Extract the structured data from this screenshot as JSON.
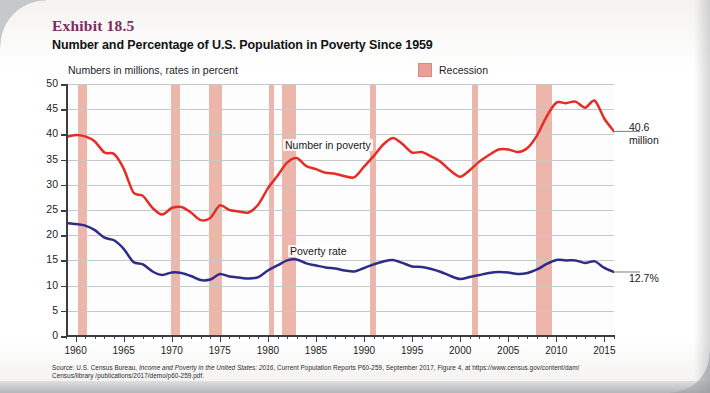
{
  "exhibit": {
    "label": "Exhibit 18.5",
    "title": "Number and Percentage of U.S. Population in Poverty Since 1959",
    "subtitle": "Numbers in millions, rates in percent"
  },
  "legend": {
    "recession_label": "Recession",
    "recession_color": "#e8a194"
  },
  "callouts": {
    "number_value": "40.6",
    "number_unit": "million",
    "rate_value": "12.7%"
  },
  "source": {
    "line1_a": "Source: U.S. Census Bureau, ",
    "line1_b": "Income and Poverty in the United States: 2016",
    "line1_c": ", Current Population Reports P60-259, September 2017, Figure 4, at https://www.census.gov/content/dam/",
    "line2": "Census/library /publications/2017/demo/p60-259.pdf."
  },
  "chart_data": {
    "type": "line",
    "title": "Number and Percentage of U.S. Population in Poverty Since 1959",
    "subtitle": "Numbers in millions, rates in percent",
    "xlabel": "",
    "ylabel": "",
    "xlim": [
      1959,
      2016
    ],
    "ylim": [
      0,
      50
    ],
    "ytick_labels": [
      "0",
      "5",
      "10",
      "15",
      "20",
      "25",
      "30",
      "35",
      "40",
      "45",
      "50"
    ],
    "ytick_values": [
      0,
      5,
      10,
      15,
      20,
      25,
      30,
      35,
      40,
      45,
      50
    ],
    "xtick_labels": [
      "1960",
      "1965",
      "1970",
      "1975",
      "1980",
      "1985",
      "1990",
      "1995",
      "2000",
      "2005",
      "2010",
      "2015"
    ],
    "xtick_values": [
      1960,
      1965,
      1970,
      1975,
      1980,
      1985,
      1990,
      1995,
      2000,
      2005,
      2010,
      2015
    ],
    "grid": "horizontal",
    "legend_position": "top-right",
    "x": [
      1959,
      1960,
      1961,
      1962,
      1963,
      1964,
      1965,
      1966,
      1967,
      1968,
      1969,
      1970,
      1971,
      1972,
      1973,
      1974,
      1975,
      1976,
      1977,
      1978,
      1979,
      1980,
      1981,
      1982,
      1983,
      1984,
      1985,
      1986,
      1987,
      1988,
      1989,
      1990,
      1991,
      1992,
      1993,
      1994,
      1995,
      1996,
      1997,
      1998,
      1999,
      2000,
      2001,
      2002,
      2003,
      2004,
      2005,
      2006,
      2007,
      2008,
      2009,
      2010,
      2011,
      2012,
      2013,
      2014,
      2015,
      2016
    ],
    "series": [
      {
        "name": "Number in poverty",
        "color": "#e52d27",
        "unit": "millions",
        "label_position": {
          "x": 283,
          "y": 139
        },
        "end_annotation": "40.6 million",
        "values": [
          39.5,
          39.9,
          39.6,
          38.6,
          36.4,
          36.1,
          33.2,
          28.5,
          27.8,
          25.4,
          24.1,
          25.4,
          25.6,
          24.5,
          23.0,
          23.4,
          25.9,
          25.0,
          24.7,
          24.5,
          26.1,
          29.3,
          31.8,
          34.4,
          35.3,
          33.7,
          33.1,
          32.4,
          32.2,
          31.7,
          31.5,
          33.6,
          35.7,
          38.0,
          39.3,
          38.1,
          36.4,
          36.5,
          35.6,
          34.5,
          32.8,
          31.6,
          32.9,
          34.6,
          35.9,
          37.0,
          37.0,
          36.5,
          37.3,
          39.8,
          43.6,
          46.3,
          46.2,
          46.5,
          45.3,
          46.7,
          43.1,
          40.6
        ]
      },
      {
        "name": "Poverty rate",
        "color": "#2e2c87",
        "unit": "percent",
        "label_position": {
          "x": 288,
          "y": 245
        },
        "end_annotation": "12.7%",
        "values": [
          22.4,
          22.2,
          21.9,
          21.0,
          19.5,
          19.0,
          17.3,
          14.7,
          14.2,
          12.8,
          12.1,
          12.6,
          12.5,
          11.9,
          11.1,
          11.2,
          12.3,
          11.8,
          11.6,
          11.4,
          11.7,
          13.0,
          14.0,
          15.0,
          15.2,
          14.4,
          14.0,
          13.6,
          13.4,
          13.0,
          12.8,
          13.5,
          14.2,
          14.8,
          15.1,
          14.5,
          13.8,
          13.7,
          13.3,
          12.7,
          11.9,
          11.3,
          11.7,
          12.1,
          12.5,
          12.7,
          12.6,
          12.3,
          12.5,
          13.2,
          14.3,
          15.1,
          15.0,
          15.0,
          14.5,
          14.8,
          13.5,
          12.7
        ]
      }
    ],
    "recession_bands": [
      {
        "start": 1960.3,
        "end": 1961.2
      },
      {
        "start": 1969.9,
        "end": 1970.9
      },
      {
        "start": 1973.9,
        "end": 1975.2
      },
      {
        "start": 1980.1,
        "end": 1980.6
      },
      {
        "start": 1981.5,
        "end": 1982.9
      },
      {
        "start": 1990.6,
        "end": 1991.2
      },
      {
        "start": 2001.2,
        "end": 2001.9
      },
      {
        "start": 2007.9,
        "end": 2009.5
      }
    ]
  }
}
